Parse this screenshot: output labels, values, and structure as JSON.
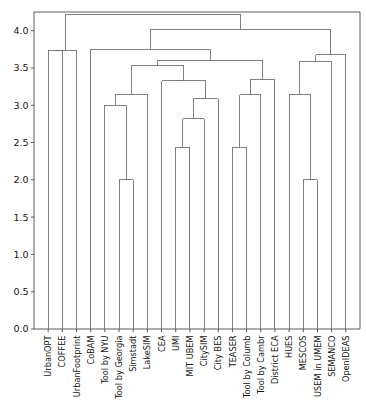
{
  "chart_data": {
    "type": "dendrogram",
    "title": "",
    "xlabel": "",
    "ylabel": "",
    "ylim": [
      0.0,
      4.25
    ],
    "grid": false,
    "legend": null,
    "orientation": "top-down",
    "leaf_label_rotation": 90,
    "yticks": [
      "0.0",
      "0.5",
      "1.0",
      "1.5",
      "2.0",
      "2.5",
      "3.0",
      "3.5",
      "4.0"
    ],
    "ytick_values": [
      0.0,
      0.5,
      1.0,
      1.5,
      2.0,
      2.5,
      3.0,
      3.5,
      4.0
    ],
    "leaves": [
      "UrbanOPT",
      "COFFEE",
      "UrbanFootprint",
      "CoBAM",
      "Tool by NYU",
      "Tool by Georgia",
      "Simstadt",
      "LakeSIM",
      "CEA",
      "UMI",
      "MIT UBEM",
      "CitySIM",
      "City BES",
      "TEASER",
      "Tool by Columb",
      "Tool by Cambr",
      "District ECA",
      "HUES",
      "MESCOS",
      "USEM in UMEM",
      "SEMANCO",
      "OpenIDEAS"
    ],
    "n_leaves": 22,
    "line_color": "#6b6b6b",
    "merges": [
      {
        "id": "m1",
        "left": "UrbanOPT",
        "right": "COFFEE",
        "height": 3.74
      },
      {
        "id": "m2",
        "left": "m1",
        "right": "UrbanFootprint",
        "height": 3.74
      },
      {
        "id": "m3",
        "left": "Tool by Georgia",
        "right": "Simstadt",
        "height": 2.0
      },
      {
        "id": "m4",
        "left": "Tool by NYU",
        "right": "m3",
        "height": 3.0
      },
      {
        "id": "m5",
        "left": "m4",
        "right": "LakeSIM",
        "height": 3.15
      },
      {
        "id": "m6",
        "left": "UMI",
        "right": "MIT UBEM",
        "height": 2.44
      },
      {
        "id": "m7",
        "left": "m6",
        "right": "CitySIM",
        "height": 2.82
      },
      {
        "id": "m8",
        "left": "m7",
        "right": "City BES",
        "height": 3.09
      },
      {
        "id": "m9",
        "left": "CEA",
        "right": "m8",
        "height": 3.33
      },
      {
        "id": "m10",
        "left": "m5",
        "right": "m9",
        "height": 3.53
      },
      {
        "id": "m11",
        "left": "TEASER",
        "right": "Tool by Columb",
        "height": 2.44
      },
      {
        "id": "m12",
        "left": "m11",
        "right": "Tool by Cambr",
        "height": 3.14
      },
      {
        "id": "m13",
        "left": "m12",
        "right": "District ECA",
        "height": 3.35
      },
      {
        "id": "m14",
        "left": "m10",
        "right": "m13",
        "height": 3.6
      },
      {
        "id": "m15",
        "left": "CoBAM",
        "right": "m14",
        "height": 3.75
      },
      {
        "id": "m16",
        "left": "MESCOS",
        "right": "USEM in UMEM",
        "height": 2.0
      },
      {
        "id": "m17",
        "left": "HUES",
        "right": "m16",
        "height": 3.15
      },
      {
        "id": "m18",
        "left": "m17",
        "right": "SEMANCO",
        "height": 3.59
      },
      {
        "id": "m19",
        "left": "m18",
        "right": "OpenIDEAS",
        "height": 3.68
      },
      {
        "id": "m20",
        "left": "m15",
        "right": "m19",
        "height": 4.02
      },
      {
        "id": "m21",
        "left": "m2",
        "right": "m20",
        "height": 4.22
      }
    ]
  }
}
